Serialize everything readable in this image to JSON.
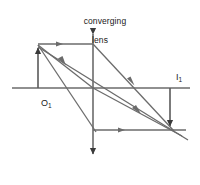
{
  "figure": {
    "kind": "optics-ray-diagram",
    "title_line1": "converging",
    "title_line2": "lens",
    "object_label_main": "O",
    "object_label_sub": "1",
    "image_label_main": "I",
    "image_label_sub": "1",
    "stroke_color": "#4d4d4d",
    "text_color": "#1a1a1a",
    "background_color": "#ffffff"
  },
  "diagram": {
    "principal_axis": {
      "x1": 12,
      "y1": 88,
      "x2": 190,
      "y2": 88
    },
    "lens": {
      "x": 93,
      "y_top": 30,
      "y_bottom": 158,
      "double_headed": true
    },
    "object_arrow": {
      "x": 38,
      "y_base": 88,
      "y_tip": 44,
      "direction": "up"
    },
    "image_arrow": {
      "x": 170,
      "y_base": 88,
      "y_tip": 130,
      "direction": "down"
    },
    "rays": [
      {
        "name": "parallel-ray-incident",
        "x1": 38,
        "y1": 44,
        "x2": 93,
        "y2": 44
      },
      {
        "name": "parallel-ray-refracted",
        "x1": 93,
        "y1": 44,
        "x2": 172,
        "y2": 130
      },
      {
        "name": "chief-ray-incident",
        "x1": 38,
        "y1": 44,
        "x2": 93,
        "y2": 88
      },
      {
        "name": "chief-ray-refracted",
        "x1": 93,
        "y1": 88,
        "x2": 178,
        "y2": 134
      },
      {
        "name": "focal-ray-incident",
        "x1": 38,
        "y1": 44,
        "x2": 93,
        "y2": 130
      },
      {
        "name": "focal-ray-refracted",
        "x1": 93,
        "y1": 130,
        "x2": 185,
        "y2": 130
      },
      {
        "name": "auxiliary-ray",
        "x1": 38,
        "y1": 46,
        "x2": 180,
        "y2": 138
      }
    ]
  }
}
